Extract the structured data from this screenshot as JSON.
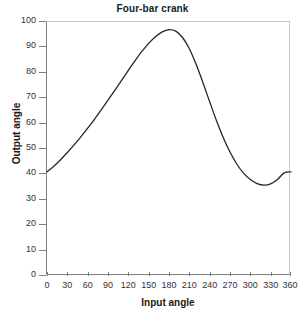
{
  "chart_data": {
    "type": "line",
    "title": "Four-bar crank",
    "xlabel": "Input angle",
    "ylabel": "Output angle",
    "xlim": [
      0,
      360
    ],
    "ylim": [
      0,
      100
    ],
    "grid": false,
    "legend": null,
    "xticks": [
      0,
      30,
      60,
      90,
      120,
      150,
      180,
      210,
      240,
      270,
      300,
      330,
      360
    ],
    "yticks": [
      0,
      10,
      20,
      30,
      40,
      50,
      60,
      70,
      80,
      90,
      100
    ],
    "line_color": "#262626",
    "x": [
      0,
      10,
      20,
      30,
      40,
      50,
      60,
      70,
      80,
      90,
      100,
      110,
      120,
      130,
      140,
      150,
      160,
      170,
      180,
      190,
      200,
      210,
      220,
      230,
      240,
      250,
      260,
      270,
      280,
      290,
      300,
      310,
      320,
      330,
      340,
      350,
      360
    ],
    "values": [
      41.0,
      43.2,
      45.8,
      48.6,
      51.6,
      54.8,
      58.2,
      61.7,
      65.4,
      69.2,
      73.1,
      77.0,
      81.0,
      84.8,
      88.4,
      91.6,
      94.2,
      96.1,
      97.0,
      96.4,
      93.9,
      89.5,
      83.4,
      76.2,
      68.6,
      61.2,
      54.5,
      48.8,
      44.1,
      40.5,
      38.0,
      36.4,
      35.8,
      36.3,
      38.0,
      40.6,
      41.0
    ],
    "annotations": []
  },
  "axis": {
    "yticks_labels": [
      "100",
      "90",
      "80",
      "70",
      "60",
      "50",
      "40",
      "30",
      "20",
      "10",
      "0"
    ],
    "xticks_labels": [
      "0",
      "30",
      "60",
      "90",
      "120",
      "150",
      "180",
      "210",
      "240",
      "270",
      "300",
      "330",
      "360"
    ]
  }
}
